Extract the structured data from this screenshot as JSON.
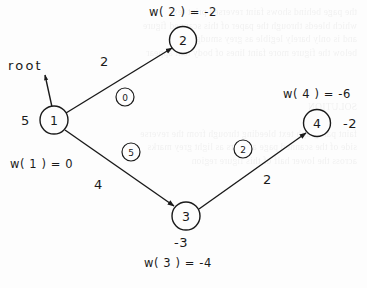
{
  "figure": {
    "background_color": "#fdfdfd",
    "ink_color": "#1a1a1a",
    "bleed_through_text": "the page behind shows faint reversed print text\nwhich bleeds through the paper of this scanned figure\nand is only barely legible as grey smudges here\nbelow the figure more faint lines of body text appear\n\n\n\nSOLUTION\n\nfaint paragraph text bleeding through from the reverse\nside of the scanned page appears as light grey marks\nacross the lower half of this figure region"
  },
  "nodes": [
    {
      "id": "node-1",
      "label": "1",
      "cx": 54,
      "cy": 120,
      "r": 14,
      "value": "5",
      "value_x": 21,
      "value_y": 114,
      "weight_label": "w( 1 ) = 0",
      "weight_x": 10,
      "weight_y": 159
    },
    {
      "id": "node-2",
      "label": "2",
      "cx": 183,
      "cy": 40,
      "r": 13.5,
      "value": "",
      "value_x": 0,
      "value_y": 0,
      "weight_label": "w( 2 ) = -2",
      "weight_x": 149,
      "weight_y": 7
    },
    {
      "id": "node-3",
      "label": "3",
      "cx": 186,
      "cy": 216,
      "r": 14,
      "value": "-3",
      "value_x": 174,
      "value_y": 236,
      "weight_label": "w( 3 ) = -4",
      "weight_x": 144,
      "weight_y": 258
    },
    {
      "id": "node-4",
      "label": "4",
      "cx": 317,
      "cy": 123,
      "r": 13.5,
      "value": "-2",
      "value_x": 343,
      "value_y": 117,
      "weight_label": "w( 4 ) = -6",
      "weight_x": 283,
      "weight_y": 89
    }
  ],
  "root": {
    "label": "root",
    "label_x": 8,
    "label_y": 59,
    "arrow_from": {
      "x": 52,
      "y": 107
    },
    "arrow_to": {
      "x": 45,
      "y": 75
    }
  },
  "edges": [
    {
      "id": "edge-1-2",
      "from": "1",
      "to": "2",
      "cost": "2",
      "cost_x": 100,
      "cost_y": 55,
      "badge": "0",
      "badge_cx": 125,
      "badge_cy": 97,
      "badge_r": 9,
      "x1": 66,
      "y1": 113,
      "x2": 172,
      "y2": 48
    },
    {
      "id": "edge-1-3",
      "from": "1",
      "to": "3",
      "cost": "4",
      "cost_x": 94,
      "cost_y": 178,
      "badge": "5",
      "badge_cx": 131,
      "badge_cy": 152,
      "badge_r": 9,
      "x1": 65,
      "y1": 130,
      "x2": 174,
      "y2": 206
    },
    {
      "id": "edge-3-4",
      "from": "3",
      "to": "4",
      "cost": "2",
      "cost_x": 263,
      "cost_y": 173,
      "badge": "2",
      "badge_cx": 243,
      "badge_cy": 149,
      "badge_r": 9,
      "x1": 199,
      "y1": 209,
      "x2": 306,
      "y2": 133
    }
  ],
  "chart_data": {
    "type": "diagram-graph",
    "vertices": [
      {
        "name": "1",
        "w": 0,
        "annotation": "5"
      },
      {
        "name": "2",
        "w": -2,
        "annotation": ""
      },
      {
        "name": "3",
        "w": -4,
        "annotation": "-3"
      },
      {
        "name": "4",
        "w": -6,
        "annotation": "-2"
      }
    ],
    "arcs": [
      {
        "tail": "1",
        "head": "2",
        "cost": 2,
        "reduced_cost": 0
      },
      {
        "tail": "1",
        "head": "3",
        "cost": 4,
        "reduced_cost": 5
      },
      {
        "tail": "3",
        "head": "4",
        "cost": 2,
        "reduced_cost": 2
      }
    ],
    "root": "1"
  }
}
